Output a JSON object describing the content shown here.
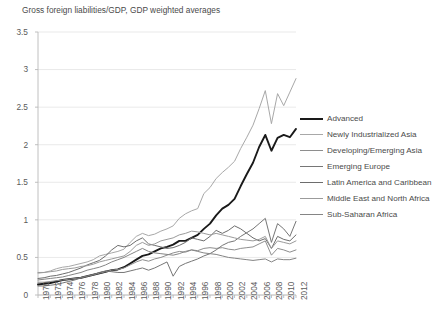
{
  "chart_data": {
    "type": "line",
    "title": "Gross foreign liabilities/GDP, GDP weighted averages",
    "xlabel": "",
    "ylabel": "",
    "xlim": [
      1970,
      2012
    ],
    "ylim": [
      0,
      3.5
    ],
    "grid": true,
    "legend_position": "right",
    "yticks": [
      "0",
      "0.5",
      "1",
      "1.5",
      "2",
      "2.5",
      "3",
      "3.5"
    ],
    "ytick_values": [
      0,
      0.5,
      1,
      1.5,
      2,
      2.5,
      3,
      3.5
    ],
    "xticks": [
      "1970",
      "1972",
      "1974",
      "1976",
      "1978",
      "1980",
      "1982",
      "1984",
      "1986",
      "1988",
      "1990",
      "1992",
      "1994",
      "1996",
      "1998",
      "2000",
      "2002",
      "2004",
      "2006",
      "2008",
      "2010",
      "2012"
    ],
    "x": [
      1970,
      1971,
      1972,
      1973,
      1974,
      1975,
      1976,
      1977,
      1978,
      1979,
      1980,
      1981,
      1982,
      1983,
      1984,
      1985,
      1986,
      1987,
      1988,
      1989,
      1990,
      1991,
      1992,
      1993,
      1994,
      1995,
      1996,
      1997,
      1998,
      1999,
      2000,
      2001,
      2002,
      2003,
      2004,
      2005,
      2006,
      2007,
      2008,
      2009,
      2010,
      2011,
      2012
    ],
    "series": [
      {
        "name": "Advanced",
        "color": "#1a1a1a",
        "width": 1.9,
        "values": [
          0.14,
          0.15,
          0.16,
          0.18,
          0.2,
          0.21,
          0.22,
          0.23,
          0.25,
          0.27,
          0.29,
          0.31,
          0.33,
          0.34,
          0.37,
          0.42,
          0.47,
          0.52,
          0.54,
          0.58,
          0.62,
          0.64,
          0.67,
          0.72,
          0.72,
          0.76,
          0.8,
          0.88,
          0.95,
          1.06,
          1.15,
          1.2,
          1.28,
          1.45,
          1.61,
          1.76,
          1.97,
          2.13,
          1.92,
          2.09,
          2.13,
          2.1,
          2.21
        ]
      },
      {
        "name": "Newly Industrialized Asia",
        "color": "#a8a8a8",
        "width": 1.0,
        "values": [
          0.29,
          0.3,
          0.32,
          0.35,
          0.37,
          0.38,
          0.4,
          0.42,
          0.44,
          0.47,
          0.52,
          0.54,
          0.56,
          0.58,
          0.61,
          0.7,
          0.78,
          0.82,
          0.79,
          0.81,
          0.85,
          0.88,
          0.92,
          1.02,
          1.08,
          1.12,
          1.15,
          1.35,
          1.43,
          1.55,
          1.63,
          1.7,
          1.78,
          1.95,
          2.1,
          2.26,
          2.48,
          2.72,
          2.28,
          2.68,
          2.52,
          2.7,
          2.88
        ]
      },
      {
        "name": "Developing/Emerging Asia",
        "color": "#8e8e8e",
        "width": 1.0,
        "values": [
          0.17,
          0.17,
          0.18,
          0.19,
          0.2,
          0.21,
          0.22,
          0.23,
          0.25,
          0.27,
          0.29,
          0.31,
          0.33,
          0.34,
          0.36,
          0.4,
          0.44,
          0.47,
          0.45,
          0.48,
          0.5,
          0.53,
          0.56,
          0.58,
          0.57,
          0.6,
          0.59,
          0.62,
          0.63,
          0.62,
          0.63,
          0.61,
          0.6,
          0.62,
          0.63,
          0.64,
          0.68,
          0.72,
          0.53,
          0.62,
          0.6,
          0.57,
          0.6
        ]
      },
      {
        "name": "Emerging Europe",
        "color": "#767676",
        "width": 1.0,
        "values": [
          0.12,
          0.12,
          0.13,
          0.14,
          0.16,
          0.18,
          0.2,
          0.23,
          0.25,
          0.27,
          0.3,
          0.32,
          0.31,
          0.3,
          0.3,
          0.32,
          0.34,
          0.36,
          0.33,
          0.36,
          0.4,
          0.44,
          0.25,
          0.38,
          0.42,
          0.45,
          0.48,
          0.52,
          0.55,
          0.6,
          0.66,
          0.7,
          0.72,
          0.78,
          0.83,
          0.88,
          0.95,
          1.02,
          0.7,
          0.95,
          0.88,
          0.78,
          0.98
        ]
      },
      {
        "name": "Latin America and Caribbean",
        "color": "#6d6d6d",
        "width": 1.0,
        "values": [
          0.22,
          0.23,
          0.25,
          0.26,
          0.28,
          0.3,
          0.33,
          0.36,
          0.4,
          0.43,
          0.46,
          0.52,
          0.6,
          0.66,
          0.64,
          0.66,
          0.72,
          0.76,
          0.68,
          0.66,
          0.64,
          0.62,
          0.63,
          0.66,
          0.7,
          0.76,
          0.74,
          0.72,
          0.78,
          0.86,
          0.82,
          0.86,
          0.92,
          0.88,
          0.82,
          0.76,
          0.72,
          0.75,
          0.62,
          0.78,
          0.74,
          0.72,
          0.8
        ]
      },
      {
        "name": "Middle East and North Africa",
        "color": "#9b9b9b",
        "width": 1.0,
        "values": [
          0.3,
          0.3,
          0.31,
          0.32,
          0.34,
          0.35,
          0.36,
          0.38,
          0.39,
          0.41,
          0.44,
          0.46,
          0.48,
          0.5,
          0.52,
          0.58,
          0.66,
          0.7,
          0.66,
          0.68,
          0.72,
          0.74,
          0.76,
          0.8,
          0.82,
          0.85,
          0.84,
          0.82,
          0.8,
          0.82,
          0.8,
          0.78,
          0.76,
          0.74,
          0.73,
          0.72,
          0.74,
          0.78,
          0.62,
          0.72,
          0.7,
          0.68,
          0.72
        ]
      },
      {
        "name": "Sub-Saharan Africa",
        "color": "#858585",
        "width": 1.0,
        "values": [
          0.2,
          0.21,
          0.22,
          0.23,
          0.24,
          0.26,
          0.28,
          0.3,
          0.33,
          0.35,
          0.37,
          0.4,
          0.44,
          0.47,
          0.5,
          0.54,
          0.58,
          0.62,
          0.58,
          0.56,
          0.55,
          0.54,
          0.53,
          0.55,
          0.58,
          0.6,
          0.58,
          0.56,
          0.55,
          0.54,
          0.52,
          0.5,
          0.49,
          0.48,
          0.47,
          0.46,
          0.47,
          0.48,
          0.44,
          0.48,
          0.47,
          0.47,
          0.49
        ]
      }
    ]
  }
}
